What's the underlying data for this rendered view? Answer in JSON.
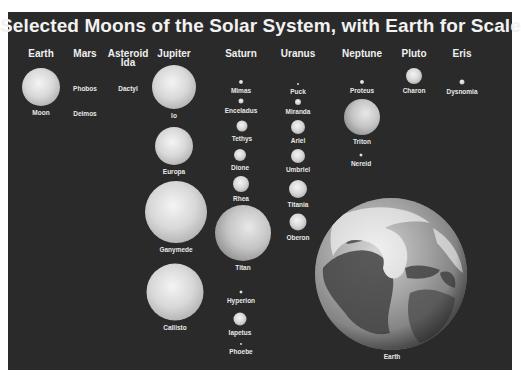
{
  "title": "Selected Moons of the Solar System, with Earth for Scale",
  "columns": [
    {
      "header": "Earth",
      "x": 41
    },
    {
      "header": "Mars",
      "x": 85
    },
    {
      "header": "Asteroid Ida",
      "x": 128
    },
    {
      "header": "Jupiter",
      "x": 174
    },
    {
      "header": "Saturn",
      "x": 241
    },
    {
      "header": "Uranus",
      "x": 298
    },
    {
      "header": "Neptune",
      "x": 362
    },
    {
      "header": "Pluto",
      "x": 414
    },
    {
      "header": "Eris",
      "x": 462
    }
  ],
  "moons": [
    {
      "name": "Moon",
      "parent": "Earth",
      "x": 41,
      "y": 87,
      "d": 38
    },
    {
      "name": "Phobos",
      "parent": "Mars",
      "x": 85,
      "y": 89,
      "d": 0
    },
    {
      "name": "Deimos",
      "parent": "Mars",
      "x": 85,
      "y": 114,
      "d": 0
    },
    {
      "name": "Dactyl",
      "parent": "Asteroid Ida",
      "x": 128,
      "y": 89,
      "d": 0
    },
    {
      "name": "Io",
      "parent": "Jupiter",
      "x": 174,
      "y": 87,
      "d": 44
    },
    {
      "name": "Europa",
      "parent": "Jupiter",
      "x": 174,
      "y": 146,
      "d": 38
    },
    {
      "name": "Ganymede",
      "parent": "Jupiter",
      "x": 176,
      "y": 212,
      "d": 62
    },
    {
      "name": "Callisto",
      "parent": "Jupiter",
      "x": 175,
      "y": 292,
      "d": 57
    },
    {
      "name": "Mimas",
      "parent": "Saturn",
      "x": 241,
      "y": 82,
      "d": 4
    },
    {
      "name": "Enceladus",
      "parent": "Saturn",
      "x": 241,
      "y": 101,
      "d": 5
    },
    {
      "name": "Tethys",
      "parent": "Saturn",
      "x": 242,
      "y": 126,
      "d": 11
    },
    {
      "name": "Dione",
      "parent": "Saturn",
      "x": 240,
      "y": 155,
      "d": 12
    },
    {
      "name": "Rhea",
      "parent": "Saturn",
      "x": 241,
      "y": 184,
      "d": 16
    },
    {
      "name": "Titan",
      "parent": "Saturn",
      "x": 243,
      "y": 233,
      "d": 56
    },
    {
      "name": "Hyperion",
      "parent": "Saturn",
      "x": 241,
      "y": 292,
      "d": 3
    },
    {
      "name": "Iapetus",
      "parent": "Saturn",
      "x": 240,
      "y": 319,
      "d": 13
    },
    {
      "name": "Phoebe",
      "parent": "Saturn",
      "x": 241,
      "y": 344,
      "d": 2
    },
    {
      "name": "Puck",
      "parent": "Uranus",
      "x": 298,
      "y": 84,
      "d": 2
    },
    {
      "name": "Miranda",
      "parent": "Uranus",
      "x": 298,
      "y": 102,
      "d": 6
    },
    {
      "name": "Ariel",
      "parent": "Uranus",
      "x": 298,
      "y": 127,
      "d": 14
    },
    {
      "name": "Umbriel",
      "parent": "Uranus",
      "x": 298,
      "y": 156,
      "d": 14
    },
    {
      "name": "Titania",
      "parent": "Uranus",
      "x": 298,
      "y": 189,
      "d": 18
    },
    {
      "name": "Oberon",
      "parent": "Uranus",
      "x": 298,
      "y": 222,
      "d": 17
    },
    {
      "name": "Proteus",
      "parent": "Neptune",
      "x": 362,
      "y": 82,
      "d": 4
    },
    {
      "name": "Triton",
      "parent": "Neptune",
      "x": 362,
      "y": 117,
      "d": 36
    },
    {
      "name": "Nereid",
      "parent": "Neptune",
      "x": 361,
      "y": 155,
      "d": 3
    },
    {
      "name": "Charon",
      "parent": "Pluto",
      "x": 414,
      "y": 76,
      "d": 16
    },
    {
      "name": "Dysnomia",
      "parent": "Eris",
      "x": 462,
      "y": 82,
      "d": 5
    }
  ],
  "earth": {
    "name": "Earth",
    "label_x": 392,
    "label_y": 353
  }
}
